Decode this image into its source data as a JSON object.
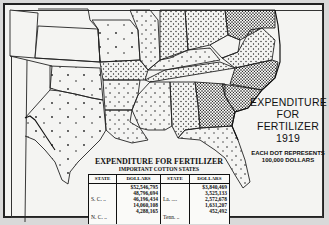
{
  "map": {
    "title_lines": [
      "EXPENDITURE",
      "FOR",
      "FERTILIZER",
      "1919"
    ],
    "note_lines": [
      "EACH DOT REPRESENTS",
      "100,000 DOLLARS"
    ],
    "dot_value": "100,000 DOLLARS",
    "colors": {
      "background": "#f4f4f2",
      "ink": "#111111"
    }
  },
  "table": {
    "title": "EXPENDITURE FOR FERTILIZER",
    "subtitle": "IMPORTANT COTTON STATES",
    "headers": [
      "STATE",
      "DOLLARS",
      "STATE",
      "DOLLARS"
    ],
    "left": [
      {
        "state": "S. C. ..",
        "dollars": "$52,546,795"
      },
      {
        "state": "N. C. ..",
        "dollars": "48,796,694"
      },
      {
        "state": "Ga ....",
        "dollars": "46,196,434"
      },
      {
        "state": "Ala ....",
        "dollars": "14,060,108"
      },
      {
        "state": "Miss ..",
        "dollars": "4,288,165"
      }
    ],
    "right": [
      {
        "state": "La. ....",
        "dollars": "$3,840,469"
      },
      {
        "state": "Tenn. ..",
        "dollars": "3,525,133"
      },
      {
        "state": "Ark. ...",
        "dollars": "2,572,678"
      },
      {
        "state": "Tex. ...",
        "dollars": "1,631,207"
      },
      {
        "state": "Okla. ..",
        "dollars": "452,492"
      }
    ]
  }
}
